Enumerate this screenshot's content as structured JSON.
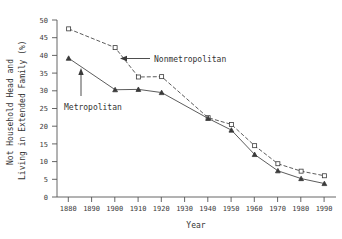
{
  "chart_data": {
    "type": "line",
    "title": "",
    "xlabel": "Year",
    "ylabel": "Not Household Head and Living in Extended Family (%)",
    "ylabel_line1": "Not Household Head and",
    "ylabel_line2": "Living in Extended Family (%)",
    "x": [
      1880,
      1900,
      1910,
      1920,
      1940,
      1950,
      1960,
      1970,
      1980,
      1990
    ],
    "xlim": [
      1875,
      1995
    ],
    "ylim": [
      0,
      50
    ],
    "xticks": [
      "1880",
      "1890",
      "1900",
      "1910",
      "1920",
      "1930",
      "1940",
      "1950",
      "1960",
      "1970",
      "1980",
      "1990"
    ],
    "xtick_values": [
      1880,
      1890,
      1900,
      1910,
      1920,
      1930,
      1940,
      1950,
      1960,
      1970,
      1980,
      1990
    ],
    "yticks": [
      "0",
      "5",
      "10",
      "15",
      "20",
      "25",
      "30",
      "35",
      "40",
      "45",
      "50"
    ],
    "ytick_values": [
      0,
      5,
      10,
      15,
      20,
      25,
      30,
      35,
      40,
      45,
      50
    ],
    "grid": false,
    "legend_position": "inline-annotations",
    "series": [
      {
        "name": "Nonmetropolitan",
        "marker": "open-square",
        "linestyle": "dashed",
        "x": [
          1880,
          1900,
          1910,
          1920,
          1940,
          1950,
          1960,
          1970,
          1980,
          1990
        ],
        "values": [
          47.5,
          42.2,
          33.9,
          34.0,
          22.4,
          20.5,
          14.5,
          9.4,
          7.3,
          6.0
        ]
      },
      {
        "name": "Metropolitan",
        "marker": "filled-triangle",
        "linestyle": "solid",
        "x": [
          1880,
          1900,
          1910,
          1920,
          1940,
          1950,
          1960,
          1970,
          1980,
          1990
        ],
        "values": [
          39.2,
          30.3,
          30.4,
          29.5,
          22.2,
          18.9,
          12.0,
          7.4,
          5.2,
          3.8
        ]
      }
    ],
    "annotations": [
      {
        "text": "Nonmetropolitan",
        "arrow": "left",
        "points_to_series": "Nonmetropolitan"
      },
      {
        "text": "Metropolitan",
        "arrow": "up",
        "points_to_series": "Metropolitan"
      }
    ]
  }
}
